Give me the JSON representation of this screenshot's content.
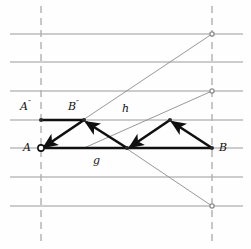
{
  "figure": {
    "kind": "geometric-construction-diagram",
    "width": 251,
    "height": 249,
    "background_color": "#fefefe"
  },
  "style": {
    "grid_line_color": "#9a9a9a",
    "dashed_line_color": "#b0b0b0",
    "thin_line_color": "#8c8c8c",
    "bold_line_color": "#101010",
    "label_color": "#101010",
    "grid_line_width": 1,
    "dashed_line_width": 1.4,
    "thin_line_width": 0.9,
    "bold_line_width": 2.6
  },
  "grid": {
    "horizontal_lines_y": [
      34,
      62,
      91,
      120,
      148,
      177,
      206
    ],
    "horizontal_x_start": 10,
    "horizontal_x_end": 243,
    "vertical_dashed_lines_x": [
      41,
      212
    ],
    "vertical_y_start": 6,
    "vertical_y_end": 241,
    "dash_pattern": "7 5"
  },
  "points": {
    "A": {
      "x": 41,
      "y": 148,
      "marker": "open-circle",
      "label": "A"
    },
    "B": {
      "x": 212,
      "y": 148,
      "marker": "dot",
      "label": "B"
    },
    "A2": {
      "x": 41,
      "y": 120,
      "marker": "dot",
      "label": "A″"
    },
    "B2": {
      "x": 84,
      "y": 120,
      "marker": "dot",
      "label": "B″"
    },
    "M": {
      "x": 127,
      "y": 148,
      "marker": "dot",
      "label": ""
    },
    "R": {
      "x": 170,
      "y": 120,
      "marker": "dot",
      "label": ""
    },
    "P_top": {
      "x": 212,
      "y": 34,
      "marker": "open-dot",
      "label": ""
    },
    "P_mid": {
      "x": 212,
      "y": 91,
      "marker": "open-dot",
      "label": ""
    },
    "P_bottom": {
      "x": 212,
      "y": 206,
      "marker": "open-dot",
      "label": ""
    }
  },
  "thin_lines": [
    {
      "name": "line-h-ascending",
      "x1": 41,
      "y1": 148,
      "x2": 212,
      "y2": 34
    },
    {
      "name": "line-g-ascending",
      "x1": 84,
      "y1": 148,
      "x2": 212,
      "y2": 91
    },
    {
      "name": "line-descending",
      "x1": 84,
      "y1": 120,
      "x2": 212,
      "y2": 206
    }
  ],
  "bold_segments": [
    {
      "name": "segment-A2-B2",
      "x1": 41,
      "y1": 120,
      "x2": 84,
      "y2": 120,
      "arrow": "none"
    },
    {
      "name": "segment-A-B",
      "x1": 41,
      "y1": 148,
      "x2": 212,
      "y2": 148,
      "arrow": "none"
    },
    {
      "name": "arrow-B2-to-A",
      "x1": 84,
      "y1": 120,
      "x2": 44,
      "y2": 147,
      "arrow": "end"
    },
    {
      "name": "arrow-M-to-B2",
      "x1": 127,
      "y1": 148,
      "x2": 86,
      "y2": 122,
      "arrow": "end"
    },
    {
      "name": "arrow-R-to-M",
      "x1": 170,
      "y1": 120,
      "x2": 130,
      "y2": 147,
      "arrow": "end"
    },
    {
      "name": "arrow-B-to-R",
      "x1": 212,
      "y1": 148,
      "x2": 172,
      "y2": 122,
      "arrow": "end"
    }
  ],
  "labels": [
    {
      "name": "label-A-double-prime",
      "text": "A",
      "prime": "″",
      "x": 20,
      "y": 101
    },
    {
      "name": "label-B-double-prime",
      "text": "B",
      "prime": "″",
      "x": 68,
      "y": 101
    },
    {
      "name": "label-h",
      "text": "h",
      "prime": "",
      "x": 122,
      "y": 103
    },
    {
      "name": "label-A",
      "text": "A",
      "prime": "",
      "x": 23,
      "y": 142
    },
    {
      "name": "label-B",
      "text": "B",
      "prime": "",
      "x": 219,
      "y": 142
    },
    {
      "name": "label-g",
      "text": "g",
      "prime": "",
      "x": 93,
      "y": 155
    }
  ]
}
